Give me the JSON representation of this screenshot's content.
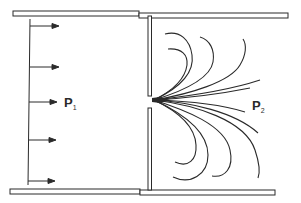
{
  "diagram": {
    "labels": {
      "upstream": {
        "main": "P",
        "sub": "1"
      },
      "downstream": {
        "main": "P",
        "sub": "2"
      }
    },
    "colors": {
      "stroke": "#2a2a2a",
      "background": "#ffffff"
    },
    "upstream_arrows": 5,
    "streamlines_above": 6,
    "streamlines_below": 6
  }
}
